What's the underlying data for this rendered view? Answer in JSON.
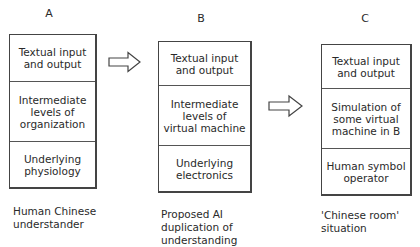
{
  "diagram": {
    "columns": [
      {
        "label": "A",
        "layers": [
          "Textual input\nand output",
          "Intermediate\nlevels of\norganization",
          "Underlying\nphysiology"
        ],
        "caption": "Human Chinese\nunderstander"
      },
      {
        "label": "B",
        "layers": [
          "Textual input\nand output",
          "Intermediate\nlevels of\nvirtual machine",
          "Underlying\nelectronics"
        ],
        "caption": "Proposed AI\nduplication of\nunderstanding"
      },
      {
        "label": "C",
        "layers": [
          "Textual input\nand output",
          "Simulation of\nsome virtual\nmachine in B",
          "Human symbol\noperator"
        ],
        "caption": "'Chinese room'\nsituation"
      }
    ],
    "arrows": [
      {
        "from": "A",
        "to": "B",
        "icon": "right-arrow-icon"
      },
      {
        "from": "B",
        "to": "C",
        "icon": "right-arrow-icon"
      }
    ],
    "colors": {
      "line": "#444444",
      "text": "#2a2a2a",
      "background": "#ffffff"
    }
  }
}
